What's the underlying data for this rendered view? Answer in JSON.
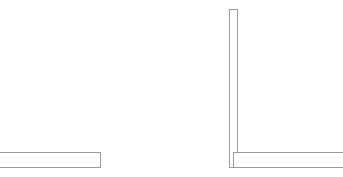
{
  "canvas": {
    "width": 343,
    "height": 177,
    "background_color": "#ffffff"
  },
  "style": {
    "stroke_color": "#9a9a9a",
    "stroke_color_dark": "#8b8b8b",
    "stroke_width": 1,
    "fill": "none"
  },
  "figures": [
    {
      "id": "left-angle-profile",
      "label": "Left flat bar outline",
      "description": "Horizontal rectangular outline clipped at the left edge of the canvas; only top, right and bottom edges are visible.",
      "clipped_edges": [
        "left"
      ],
      "bounds": {
        "x": 0,
        "y": 152,
        "width": 101,
        "height": 16
      },
      "segments": [
        {
          "name": "top-edge",
          "x1": 0,
          "y1": 152.5,
          "x2": 101,
          "y2": 152.5
        },
        {
          "name": "right-edge",
          "x1": 100.5,
          "y1": 152,
          "x2": 100.5,
          "y2": 168
        },
        {
          "name": "bottom-edge",
          "x1": 0,
          "y1": 167.5,
          "x2": 101,
          "y2": 167.5
        }
      ]
    },
    {
      "id": "right-angle-profile",
      "label": "Right L-shaped angle outline",
      "description": "An L-shaped profile: a tall narrow vertical bar rising from a horizontal bar that is clipped at the right edge of the canvas.",
      "clipped_edges": [
        "right"
      ],
      "bounds": {
        "x": 229,
        "y": 9,
        "width": 114,
        "height": 159
      },
      "segments": [
        {
          "name": "vertical-bar-top-edge",
          "x1": 229,
          "y1": 9.5,
          "x2": 238,
          "y2": 9.5
        },
        {
          "name": "vertical-bar-left-edge",
          "x1": 229.5,
          "y1": 9,
          "x2": 229.5,
          "y2": 168
        },
        {
          "name": "vertical-bar-right-edge",
          "x1": 237.5,
          "y1": 9,
          "x2": 237.5,
          "y2": 152
        },
        {
          "name": "horizontal-bar-top-edge",
          "x1": 233,
          "y1": 152.5,
          "x2": 343,
          "y2": 152.5
        },
        {
          "name": "horizontal-bar-left-edge",
          "x1": 233.5,
          "y1": 152,
          "x2": 233.5,
          "y2": 168
        },
        {
          "name": "horizontal-bar-bottom-edge",
          "x1": 229,
          "y1": 167.5,
          "x2": 343,
          "y2": 167.5
        }
      ]
    }
  ]
}
